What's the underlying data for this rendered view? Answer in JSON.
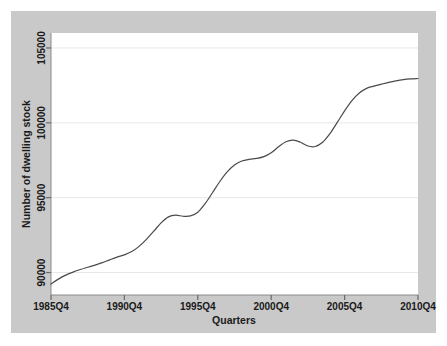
{
  "figure": {
    "background_color": "#ffffff",
    "graph_region_color": "#c9c9c9",
    "plot_area_color": "#ffffff",
    "line_color": "#4a4a4a",
    "grid_color": "#e8e8e8"
  },
  "chart_data": {
    "type": "line",
    "title": "",
    "subtitle": "",
    "xlabel": "Quarters",
    "ylabel": "Number of dwelling stock",
    "grid": true,
    "legend": null,
    "legend_position": "none",
    "xlim": [
      "1985Q4",
      "2010Q4"
    ],
    "ylim": [
      88500,
      106000
    ],
    "yticks": [
      90000,
      95000,
      100000,
      105000
    ],
    "ytick_labels": [
      "90000",
      "95000",
      "100000",
      "105000"
    ],
    "xticks": [
      "1985Q4",
      "1990Q4",
      "1995Q4",
      "2000Q4",
      "2005Q4",
      "2010Q4"
    ],
    "xtick_labels": [
      "1985Q4",
      "1990Q4",
      "1995Q4",
      "2000Q4",
      "2005Q4",
      "2010Q4"
    ],
    "series": [
      {
        "name": "Number of dwelling stock",
        "x": [
          "1985Q4",
          "1986Q2",
          "1986Q4",
          "1987Q2",
          "1987Q4",
          "1988Q2",
          "1988Q4",
          "1989Q2",
          "1989Q4",
          "1990Q2",
          "1990Q4",
          "1991Q2",
          "1991Q4",
          "1992Q2",
          "1992Q4",
          "1993Q2",
          "1993Q4",
          "1994Q2",
          "1994Q4",
          "1995Q2",
          "1995Q4",
          "1996Q2",
          "1996Q4",
          "1997Q2",
          "1997Q4",
          "1998Q2",
          "1998Q4",
          "1999Q2",
          "1999Q4",
          "2000Q2",
          "2000Q4",
          "2001Q2",
          "2001Q4",
          "2002Q2",
          "2002Q4",
          "2003Q2",
          "2003Q4",
          "2004Q2",
          "2004Q4",
          "2005Q2",
          "2005Q4",
          "2006Q2",
          "2006Q4",
          "2007Q2",
          "2007Q4",
          "2008Q2",
          "2008Q4",
          "2009Q2",
          "2009Q4",
          "2010Q2",
          "2010Q4"
        ],
        "values": [
          89230,
          89560,
          89830,
          90030,
          90200,
          90350,
          90500,
          90660,
          90850,
          91030,
          91180,
          91400,
          91750,
          92220,
          92760,
          93320,
          93720,
          93830,
          93760,
          93780,
          94030,
          94600,
          95330,
          96080,
          96720,
          97180,
          97450,
          97560,
          97620,
          97740,
          98000,
          98400,
          98740,
          98850,
          98700,
          98450,
          98420,
          98700,
          99280,
          100030,
          100800,
          101480,
          101990,
          102300,
          102450,
          102580,
          102700,
          102800,
          102880,
          102930,
          102960
        ]
      }
    ]
  },
  "axes": {
    "y_title": "Number of dwelling stock",
    "x_title": "Quarters"
  }
}
